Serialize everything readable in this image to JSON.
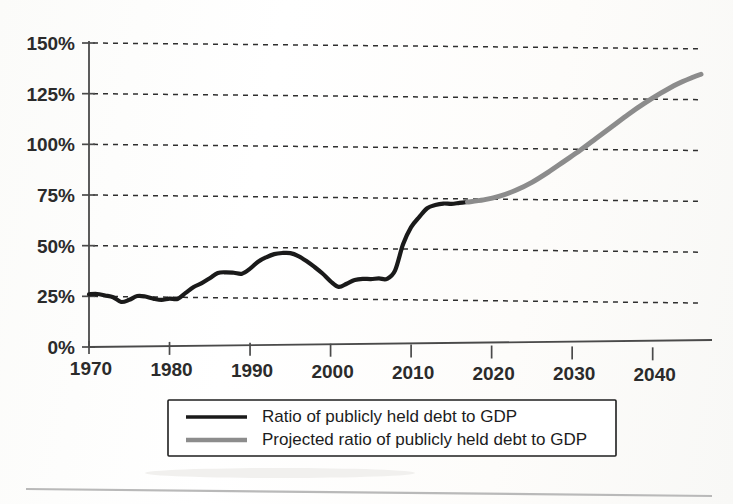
{
  "chart_data": {
    "type": "line",
    "title": "",
    "xlabel": "",
    "ylabel": "",
    "xlim": [
      1970,
      2046
    ],
    "ylim": [
      0,
      150
    ],
    "grid": true,
    "grid_axis": "y",
    "legend_position": "bottom",
    "y_ticks": [
      0,
      25,
      50,
      75,
      100,
      125,
      150
    ],
    "y_tick_labels": [
      "0%",
      "25%",
      "50%",
      "75%",
      "100%",
      "125%",
      "150%"
    ],
    "x_ticks": [
      1970,
      1980,
      1990,
      2000,
      2010,
      2020,
      2030,
      2040
    ],
    "x_tick_labels": [
      "1970",
      "1980",
      "1990",
      "2000",
      "2010",
      "2020",
      "2030",
      "2040"
    ],
    "series": [
      {
        "name": "Ratio of publicly held debt to GDP",
        "key": "actual",
        "color": "#1a1a1a",
        "width": 4.2,
        "x": [
          1970,
          1971,
          1972,
          1973,
          1974,
          1975,
          1976,
          1977,
          1978,
          1979,
          1980,
          1981,
          1982,
          1983,
          1984,
          1985,
          1986,
          1987,
          1988,
          1989,
          1990,
          1991,
          1992,
          1993,
          1994,
          1995,
          1996,
          1997,
          1998,
          1999,
          2000,
          2001,
          2002,
          2003,
          2004,
          2005,
          2006,
          2007,
          2008,
          2009,
          2010,
          2011,
          2012,
          2013,
          2014,
          2015,
          2016,
          2017
        ],
        "values": [
          26.0,
          26.2,
          25.5,
          24.7,
          22.4,
          23.5,
          25.4,
          25.2,
          24.2,
          23.6,
          24.3,
          24.2,
          27.2,
          30.2,
          32.1,
          34.6,
          37.2,
          37.6,
          37.4,
          37.0,
          39.5,
          43.0,
          45.2,
          46.8,
          47.4,
          47.4,
          46.0,
          43.6,
          40.7,
          37.5,
          33.7,
          31.0,
          32.6,
          34.5,
          35.1,
          35.0,
          35.4,
          35.2,
          39.3,
          52.3,
          60.8,
          65.8,
          70.2,
          71.8,
          72.6,
          72.5,
          73.0,
          73.5
        ]
      },
      {
        "name": "Projected ratio of publicly held debt to GDP",
        "key": "projected",
        "color": "#8c8c8c",
        "width": 5.0,
        "x": [
          2017,
          2019,
          2021,
          2023,
          2025,
          2027,
          2029,
          2031,
          2033,
          2035,
          2037,
          2039,
          2041,
          2043,
          2045,
          2046
        ],
        "values": [
          73.5,
          74.6,
          76.5,
          79.5,
          83.5,
          88.5,
          94.0,
          99.5,
          105.5,
          111.5,
          117.5,
          123.0,
          128.0,
          132.5,
          136.0,
          137.5
        ]
      }
    ],
    "annotations": []
  },
  "legend": {
    "entries": [
      {
        "label": "Ratio of publicly held debt to GDP",
        "color": "#1a1a1a",
        "style": "solid"
      },
      {
        "label": "Projected ratio of publicly held debt to GDP",
        "color": "#8c8c8c",
        "style": "solid"
      }
    ]
  }
}
